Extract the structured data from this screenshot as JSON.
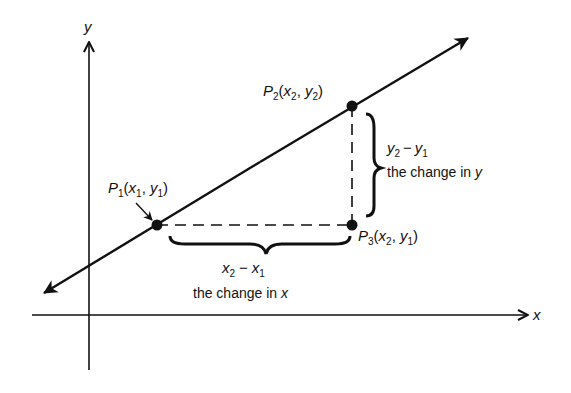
{
  "axes": {
    "x_label": "x",
    "y_label": "y"
  },
  "points": {
    "p1": {
      "name": "P",
      "index": "1",
      "coord_x": "x",
      "coord_x_sub": "1",
      "coord_y": "y",
      "coord_y_sub": "1"
    },
    "p2": {
      "name": "P",
      "index": "2",
      "coord_x": "x",
      "coord_x_sub": "2",
      "coord_y": "y",
      "coord_y_sub": "2"
    },
    "p3": {
      "name": "P",
      "index": "3",
      "coord_x": "x",
      "coord_x_sub": "2",
      "coord_y": "y",
      "coord_y_sub": "1"
    }
  },
  "annotations": {
    "rise": {
      "expr_a": "y",
      "expr_a_sub": "2",
      "minus": "−",
      "expr_b": "y",
      "expr_b_sub": "1",
      "caption_prefix": "the change in ",
      "caption_var": "y"
    },
    "run": {
      "expr_a": "x",
      "expr_a_sub": "2",
      "minus": "−",
      "expr_b": "x",
      "expr_b_sub": "1",
      "caption_prefix": "the change in ",
      "caption_var": "x"
    }
  },
  "punct": {
    "open": "(",
    "comma": ", ",
    "close": ")"
  },
  "colors": {
    "ink": "#111111",
    "background": "#ffffff"
  }
}
